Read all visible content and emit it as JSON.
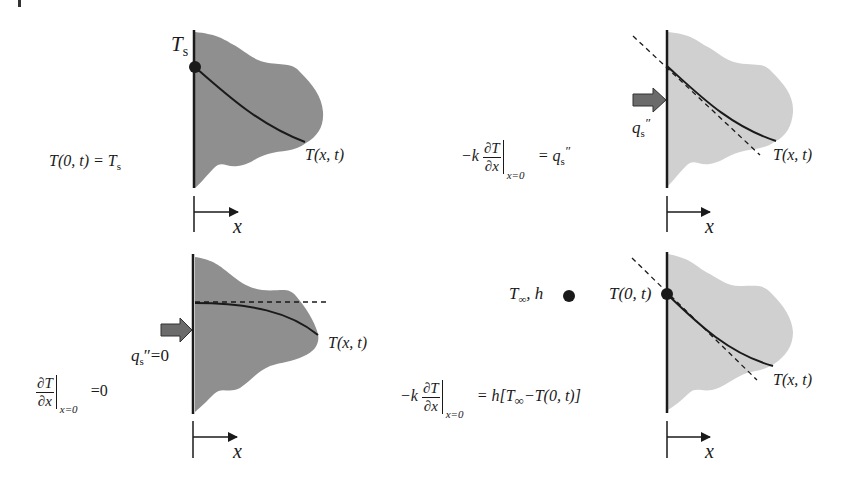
{
  "figure": {
    "colors": {
      "dark_solid": "#8f8f8f",
      "light_solid": "#d0d0d0",
      "line": "#1a1a1a",
      "arrow_fill": "#6b6b6b"
    },
    "panels": [
      {
        "id": "constant-surface-temperature",
        "point_label": "T",
        "point_label_sub": "s",
        "profile_label": "T(x, t)",
        "axis_label": "x",
        "equation": {
          "lhs": "T(0, t) = T",
          "lhs_sub": "s"
        }
      },
      {
        "id": "constant-surface-heat-flux",
        "flux_label": "q",
        "flux_sub": "s",
        "flux_prime": "″",
        "profile_label": "T(x, t)",
        "axis_label": "x",
        "equation": {
          "prefix": "−k",
          "num": "∂T",
          "den": "∂x",
          "eval_sub": "x=0",
          "rhs": "= q",
          "rhs_sub": "s",
          "rhs_prime": "″"
        }
      },
      {
        "id": "adiabatic-surface",
        "flux_label": "q",
        "flux_sub": "s",
        "flux_suffix": "″=0",
        "profile_label": "T(x, t)",
        "axis_label": "x",
        "equation": {
          "num": "∂T",
          "den": "∂x",
          "eval_sub": "x=0",
          "rhs": "=0"
        }
      },
      {
        "id": "surface-convection",
        "fluid_label": "T",
        "fluid_sub": "∞",
        "fluid_suffix": ", h",
        "surface_label": "T(0, t)",
        "profile_label": "T(x, t)",
        "axis_label": "x",
        "equation": {
          "prefix": "−k",
          "num": "∂T",
          "den": "∂x",
          "eval_sub": "x=0",
          "rhs_a": "= h[T",
          "rhs_sub": "∞",
          "rhs_b": "−T(0, t)]"
        }
      }
    ]
  }
}
